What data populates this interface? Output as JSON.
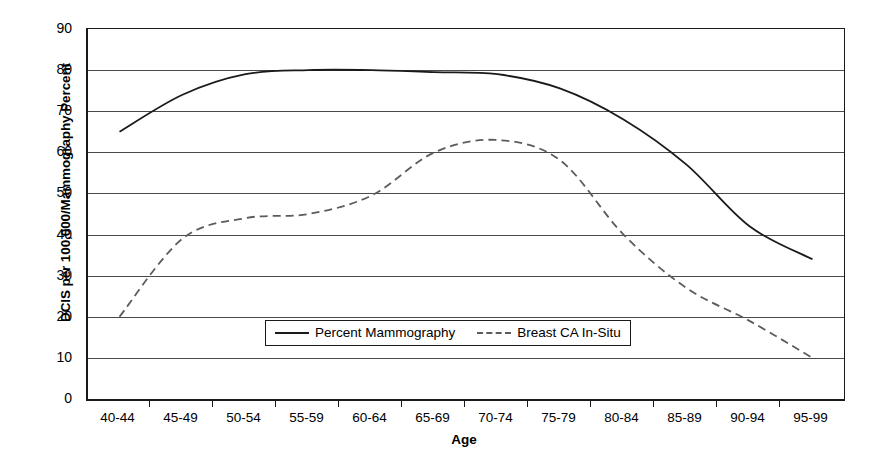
{
  "chart_data": {
    "type": "line",
    "title": "",
    "xlabel": "Age",
    "ylabel": "DCIS per 100,000/Mammography Percent",
    "ylim": [
      0,
      90
    ],
    "ytick_step": 10,
    "yticks": [
      0,
      10,
      20,
      30,
      40,
      50,
      60,
      70,
      80,
      90
    ],
    "grid": true,
    "legend_position": "inside-bottom-center",
    "categories": [
      "40-44",
      "45-49",
      "50-54",
      "55-59",
      "60-64",
      "65-69",
      "70-74",
      "75-79",
      "80-84",
      "85-89",
      "90-94",
      "95-99"
    ],
    "series": [
      {
        "name": "Percent Mammography",
        "style": "solid",
        "color": "#1a1a1a",
        "values": [
          65,
          74,
          79,
          80,
          80,
          79.5,
          79,
          75.5,
          68,
          57,
          42,
          34
        ]
      },
      {
        "name": "Breast CA In-Situ",
        "style": "dashed",
        "color": "#5c5c5c",
        "values": [
          20,
          39,
          44,
          45,
          49.5,
          60,
          63,
          58,
          40,
          27,
          19,
          10
        ]
      }
    ]
  },
  "axes": {
    "y_title": "DCIS per 100,000/Mammography Percent",
    "x_title": "Age",
    "y_tick_labels": [
      "90",
      "80",
      "70",
      "60",
      "50",
      "40",
      "30",
      "20",
      "10",
      "0"
    ],
    "x_tick_labels": [
      "40-44",
      "45-49",
      "50-54",
      "55-59",
      "60-64",
      "65-69",
      "70-74",
      "75-79",
      "80-84",
      "85-89",
      "90-94",
      "95-99"
    ]
  },
  "legend": {
    "entries": [
      {
        "label": "Percent Mammography",
        "style": "solid"
      },
      {
        "label": "Breast CA In-Situ",
        "style": "dashed"
      }
    ]
  },
  "colors": {
    "axis": "#1a1a1a",
    "gridline": "#4a4a4a",
    "series_solid": "#1a1a1a",
    "series_dashed": "#5c5c5c",
    "background": "#ffffff"
  }
}
